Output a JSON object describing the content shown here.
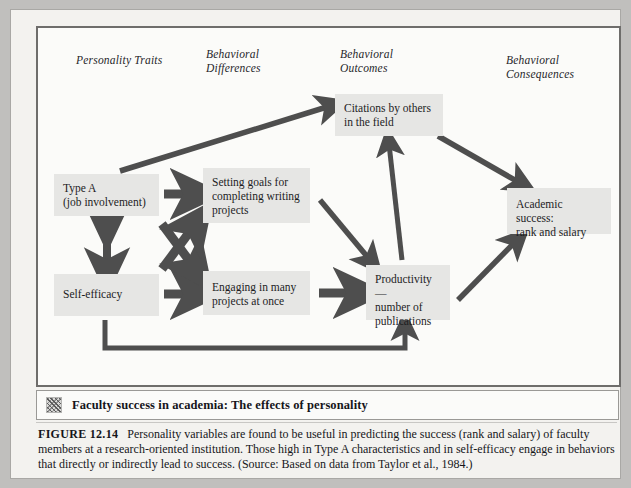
{
  "figure": {
    "column_headers": [
      {
        "id": "personality-traits",
        "label": "Personality Traits",
        "x": 38,
        "y": 26
      },
      {
        "id": "behavioral-differences",
        "label": "Behavioral\nDifferences",
        "x": 168,
        "y": 20
      },
      {
        "id": "behavioral-outcomes",
        "label": "Behavioral\nOutcomes",
        "x": 302,
        "y": 20
      },
      {
        "id": "behavioral-consequences",
        "label": "Behavioral\nConsequences",
        "x": 468,
        "y": 26
      }
    ],
    "nodes": [
      {
        "id": "type-a",
        "label": "Type A\n(job involvement)",
        "x": 16,
        "y": 146,
        "w": 105,
        "h": 42
      },
      {
        "id": "self-efficacy",
        "label": "Self-efficacy",
        "x": 16,
        "y": 246,
        "w": 105,
        "h": 42
      },
      {
        "id": "setting-goals",
        "label": "Setting goals for\ncompleting writing\nprojects",
        "x": 165,
        "y": 140,
        "w": 107,
        "h": 55
      },
      {
        "id": "engaging-projects",
        "label": "Engaging in many\nprojects at once",
        "x": 165,
        "y": 243,
        "w": 107,
        "h": 44
      },
      {
        "id": "citations",
        "label": "Citations by others\nin the field",
        "x": 297,
        "y": 66,
        "w": 108,
        "h": 42
      },
      {
        "id": "productivity",
        "label": "Productivity—\nnumber of\npublications",
        "x": 328,
        "y": 237,
        "w": 84,
        "h": 55
      },
      {
        "id": "academic-success",
        "label": "Academic success:\nrank and salary",
        "x": 469,
        "y": 160,
        "w": 104,
        "h": 46
      }
    ],
    "arrows": [
      {
        "id": "type-a-to-citations",
        "from": "type-a",
        "to": "citations"
      },
      {
        "id": "type-a-to-setting-goals",
        "from": "type-a",
        "to": "setting-goals"
      },
      {
        "id": "type-a-to-engaging-projects",
        "from": "type-a",
        "to": "engaging-projects"
      },
      {
        "id": "self-efficacy-to-setting-goals",
        "from": "self-efficacy",
        "to": "setting-goals"
      },
      {
        "id": "self-efficacy-to-engaging-projects",
        "from": "self-efficacy",
        "to": "engaging-projects"
      },
      {
        "id": "type-a-self-efficacy-bidirectional",
        "from": "type-a",
        "to": "self-efficacy",
        "double": true
      },
      {
        "id": "setting-goals-to-productivity",
        "from": "setting-goals",
        "to": "productivity"
      },
      {
        "id": "engaging-projects-to-productivity",
        "from": "engaging-projects",
        "to": "productivity"
      },
      {
        "id": "productivity-to-citations",
        "from": "productivity",
        "to": "citations"
      },
      {
        "id": "citations-to-academic-success",
        "from": "citations",
        "to": "academic-success"
      },
      {
        "id": "productivity-to-academic-success",
        "from": "productivity",
        "to": "academic-success"
      },
      {
        "id": "self-efficacy-to-productivity",
        "from": "self-efficacy",
        "to": "productivity"
      }
    ],
    "arrow_color": "#4e4e4e",
    "node_fill": "#e6e6e4"
  },
  "caption_bar": {
    "icon": "halftone-square-icon",
    "title": "Faculty success in academia: The effects of personality"
  },
  "figure_caption": {
    "label": "FIGURE 12.14",
    "text": "Personality variables are found to be useful in predicting the success (rank and salary) of faculty members at a research-oriented institution. Those high in Type A characteristics and in self-efficacy engage in behaviors that directly or indirectly lead to success.  (Source: Based on data from Taylor et al., 1984.)"
  }
}
